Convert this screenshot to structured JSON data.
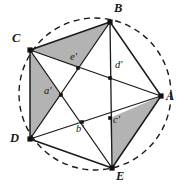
{
  "figure": {
    "colors": {
      "background": "#ffffff",
      "stroke": "#1a1a1a",
      "shading": "#b3b3b3",
      "circle_dash": "#1a1a1a",
      "label": "#1a1a1a"
    },
    "circle": {
      "cx": 95,
      "cy": 94,
      "r": 76,
      "style": "dashed"
    },
    "vertices": [
      {
        "id": "A",
        "label": "A",
        "x": 161,
        "y": 96,
        "label_x": 166,
        "label_y": 100
      },
      {
        "id": "B",
        "label": "B",
        "x": 110,
        "y": 22,
        "label_x": 114,
        "label_y": 4
      },
      {
        "id": "C",
        "label": "C",
        "x": 30,
        "y": 50,
        "label_x": 14,
        "label_y": 38
      },
      {
        "id": "D",
        "label": "D",
        "x": 30,
        "y": 139,
        "label_x": 12,
        "label_y": 139
      },
      {
        "id": "E",
        "label": "E",
        "x": 112,
        "y": 168,
        "label_x": 116,
        "label_y": 174
      }
    ],
    "inner_points": [
      {
        "id": "a",
        "label": "a'",
        "x": 61,
        "y": 95,
        "label_x": 44,
        "label_y": 90
      },
      {
        "id": "b",
        "label": "b'",
        "x": 82,
        "y": 122,
        "label_x": 76,
        "label_y": 128
      },
      {
        "id": "c",
        "label": "c'",
        "x": 110,
        "y": 118,
        "label_x": 113,
        "label_y": 119
      },
      {
        "id": "d",
        "label": "d'",
        "x": 110,
        "y": 78,
        "label_x": 115,
        "label_y": 64
      },
      {
        "id": "e",
        "label": "e'",
        "x": 78,
        "y": 68,
        "label_x": 70,
        "label_y": 56
      }
    ],
    "shaded_triangles": [
      {
        "name": "triangle-C-B-e",
        "points": "30,50 110,22 78,68"
      },
      {
        "name": "triangle-C-D-a",
        "points": "30,50 30,139 61,95"
      },
      {
        "name": "triangle-A-E-c",
        "points": "161,96 112,168 110,118"
      }
    ],
    "polygon_edges": [
      {
        "name": "edge-A-B",
        "from": "A",
        "to": "B"
      },
      {
        "name": "edge-B-C",
        "from": "B",
        "to": "C"
      },
      {
        "name": "edge-C-D",
        "from": "C",
        "to": "D"
      },
      {
        "name": "edge-D-E",
        "from": "D",
        "to": "E"
      },
      {
        "name": "edge-E-A",
        "from": "E",
        "to": "A"
      }
    ],
    "diagonals": [
      {
        "name": "diagonal-A-C",
        "from": "A",
        "to": "C"
      },
      {
        "name": "diagonal-A-D",
        "from": "A",
        "to": "D"
      },
      {
        "name": "diagonal-B-D",
        "from": "B",
        "to": "D"
      },
      {
        "name": "diagonal-B-E",
        "from": "B",
        "to": "E"
      },
      {
        "name": "diagonal-C-E",
        "from": "C",
        "to": "E"
      }
    ]
  }
}
